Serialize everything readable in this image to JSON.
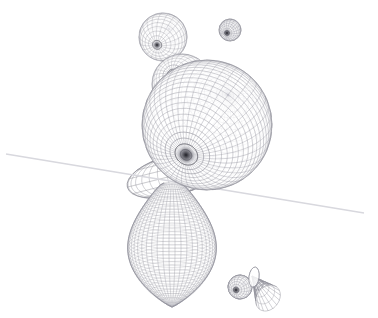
{
  "scene": {
    "title": "3D wireframe mesh render",
    "background_color": "#ffffff",
    "wire_color": "#8c8c96",
    "wire_color_light": "#b9b9c2",
    "wire_color_dark": "#3d3d46",
    "horizon_color": "#d8d8de",
    "width": 378,
    "height": 318
  },
  "objects": [
    {
      "name": "small-sphere-upper-left",
      "label": "Small wireframe sphere (upper left)",
      "shape": "sphere",
      "cx": 163,
      "cy": 37,
      "rx": 24,
      "ry": 24,
      "pole_x": 157,
      "pole_y": 45,
      "meridians": 22,
      "parallels": 16,
      "opacity": 0.85
    },
    {
      "name": "small-sphere-upper-right",
      "label": "Small dark wireframe sphere (upper right)",
      "shape": "sphere",
      "cx": 230,
      "cy": 30,
      "rx": 11,
      "ry": 11,
      "pole_x": 227,
      "pole_y": 33,
      "meridians": 20,
      "parallels": 14,
      "opacity": 1.0
    },
    {
      "name": "medium-sphere-behind",
      "label": "Medium sphere occluded behind main sphere",
      "shape": "sphere",
      "cx": 182,
      "cy": 84,
      "rx": 30,
      "ry": 30,
      "pole_x": 172,
      "pole_y": 74,
      "meridians": 26,
      "parallels": 18,
      "opacity": 0.8
    },
    {
      "name": "saucer-lens",
      "label": "Flattened lens / saucer between head and body",
      "shape": "ellipsoid",
      "cx": 172,
      "cy": 176,
      "rx": 46,
      "ry": 20,
      "rotation": -14,
      "meridians": 30,
      "parallels": 8,
      "opacity": 0.85
    },
    {
      "name": "main-sphere",
      "label": "Large main wireframe sphere with dark pole",
      "shape": "sphere",
      "cx": 207,
      "cy": 125,
      "rx": 65,
      "ry": 65,
      "pole_x": 186,
      "pole_y": 155,
      "meridians": 44,
      "parallels": 34,
      "opacity": 1.0
    },
    {
      "name": "pear-body",
      "label": "Pear / teardrop body with dense meridians",
      "shape": "teardrop",
      "cx": 172,
      "cy": 245,
      "rx": 57,
      "ry": 62,
      "neck_width": 30,
      "meridians": 46,
      "parallels": 40,
      "opacity": 1.0
    },
    {
      "name": "small-sphere-lower-right",
      "label": "Small sphere at lower right",
      "shape": "sphere",
      "cx": 240,
      "cy": 287,
      "rx": 12,
      "ry": 12,
      "pole_x": 236,
      "pole_y": 290,
      "meridians": 18,
      "parallels": 13,
      "opacity": 0.95
    },
    {
      "name": "cone-funnel",
      "label": "Cone / funnel with disc flange at lower right",
      "shape": "cone",
      "apex_x": 252,
      "apex_y": 276,
      "base_cx": 268,
      "base_cy": 298,
      "base_rx": 11,
      "base_ry": 14,
      "rotation": 38,
      "segments": 16,
      "opacity": 0.95
    }
  ],
  "horizon_line": {
    "name": "horizon-line",
    "label": "Faint diagonal horizon line",
    "x1": 6,
    "y1": 154,
    "x2": 364,
    "y2": 213,
    "color": "#d8d8de",
    "width": 1.4
  }
}
